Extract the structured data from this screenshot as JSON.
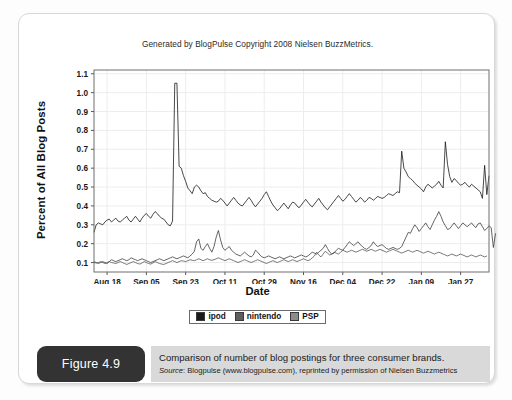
{
  "figure": {
    "badge_label": "Figure 4.9",
    "caption_main": "Comparison of number of blog postings for three consumer brands.",
    "caption_source_label": "Source",
    "caption_source_text": ": Blogpulse (www.blogpulse.com), reprinted by permission of Nielsen Buzzmetrics"
  },
  "chart_data": {
    "type": "line",
    "title": "Generated by BlogPulse Copyright 2008 Nielsen BuzzMetrics.",
    "xlabel": "Date",
    "ylabel": "Percent of All Blog Posts",
    "ylim": [
      0.05,
      1.12
    ],
    "yticks": [
      0.1,
      0.2,
      0.3,
      0.4,
      0.5,
      0.6,
      0.7,
      0.8,
      0.9,
      1.0,
      1.1
    ],
    "ytick_labels": [
      "0.1",
      "0.2",
      "0.3",
      "0.4",
      "0.5",
      "0.6",
      "0.7",
      "0.8",
      "0.9",
      "1.0",
      "1.1"
    ],
    "xtick_labels": [
      "Aug 18",
      "Sep 05",
      "Sep 23",
      "Oct 11",
      "Oct 29",
      "Nov 16",
      "Dec 04",
      "Dec 22",
      "Jan 09",
      "Jan 27"
    ],
    "xtick_positions": [
      6,
      24,
      42,
      60,
      78,
      96,
      114,
      132,
      150,
      168
    ],
    "x_count": 182,
    "grid": true,
    "legend_position": "bottom",
    "series": [
      {
        "name": "ipod",
        "color": "#1a1a1a",
        "swatch": "#1a1a1a",
        "values": [
          0.26,
          0.3,
          0.31,
          0.305,
          0.3,
          0.315,
          0.325,
          0.33,
          0.315,
          0.325,
          0.335,
          0.32,
          0.315,
          0.325,
          0.335,
          0.345,
          0.325,
          0.315,
          0.33,
          0.345,
          0.33,
          0.315,
          0.335,
          0.35,
          0.36,
          0.345,
          0.335,
          0.355,
          0.37,
          0.36,
          0.345,
          0.335,
          0.33,
          0.315,
          0.3,
          0.295,
          0.32,
          1.05,
          1.05,
          0.61,
          0.6,
          0.56,
          0.53,
          0.495,
          0.48,
          0.465,
          0.5,
          0.51,
          0.5,
          0.48,
          0.465,
          0.47,
          0.45,
          0.44,
          0.43,
          0.425,
          0.42,
          0.425,
          0.44,
          0.43,
          0.415,
          0.4,
          0.415,
          0.43,
          0.445,
          0.43,
          0.415,
          0.405,
          0.4,
          0.415,
          0.43,
          0.445,
          0.43,
          0.41,
          0.395,
          0.41,
          0.425,
          0.44,
          0.46,
          0.475,
          0.45,
          0.425,
          0.405,
          0.39,
          0.375,
          0.385,
          0.4,
          0.415,
          0.4,
          0.385,
          0.405,
          0.42,
          0.415,
          0.4,
          0.39,
          0.405,
          0.42,
          0.435,
          0.42,
          0.405,
          0.395,
          0.41,
          0.425,
          0.44,
          0.42,
          0.405,
          0.39,
          0.38,
          0.395,
          0.41,
          0.425,
          0.44,
          0.455,
          0.44,
          0.425,
          0.435,
          0.45,
          0.465,
          0.45,
          0.435,
          0.42,
          0.43,
          0.445,
          0.435,
          0.42,
          0.43,
          0.445,
          0.44,
          0.43,
          0.44,
          0.45,
          0.445,
          0.44,
          0.445,
          0.455,
          0.465,
          0.46,
          0.455,
          0.465,
          0.475,
          0.47,
          0.69,
          0.6,
          0.58,
          0.555,
          0.545,
          0.535,
          0.52,
          0.51,
          0.5,
          0.49,
          0.475,
          0.5,
          0.515,
          0.505,
          0.495,
          0.505,
          0.515,
          0.53,
          0.51,
          0.495,
          0.74,
          0.62,
          0.555,
          0.525,
          0.545,
          0.535,
          0.52,
          0.51,
          0.515,
          0.525,
          0.51,
          0.5,
          0.515,
          0.505,
          0.495,
          0.485,
          0.475,
          0.44,
          0.615,
          0.46,
          0.56
        ]
      },
      {
        "name": "nintendo",
        "color": "#3d3d3d",
        "swatch": "#5e5e5e",
        "values": [
          0.105,
          0.1,
          0.095,
          0.1,
          0.105,
          0.1,
          0.095,
          0.105,
          0.115,
          0.11,
          0.105,
          0.11,
          0.115,
          0.12,
          0.115,
          0.11,
          0.115,
          0.125,
          0.12,
          0.115,
          0.11,
          0.115,
          0.12,
          0.115,
          0.11,
          0.105,
          0.1,
          0.105,
          0.11,
          0.115,
          0.12,
          0.115,
          0.11,
          0.115,
          0.12,
          0.125,
          0.13,
          0.125,
          0.12,
          0.125,
          0.13,
          0.135,
          0.13,
          0.125,
          0.135,
          0.145,
          0.16,
          0.21,
          0.225,
          0.175,
          0.165,
          0.185,
          0.2,
          0.175,
          0.155,
          0.185,
          0.235,
          0.27,
          0.22,
          0.18,
          0.165,
          0.175,
          0.185,
          0.165,
          0.155,
          0.145,
          0.14,
          0.135,
          0.145,
          0.155,
          0.145,
          0.135,
          0.13,
          0.14,
          0.165,
          0.155,
          0.14,
          0.13,
          0.125,
          0.13,
          0.135,
          0.13,
          0.125,
          0.12,
          0.125,
          0.13,
          0.125,
          0.12,
          0.125,
          0.13,
          0.135,
          0.13,
          0.125,
          0.13,
          0.135,
          0.14,
          0.135,
          0.13,
          0.135,
          0.145,
          0.155,
          0.15,
          0.145,
          0.155,
          0.165,
          0.175,
          0.195,
          0.175,
          0.155,
          0.145,
          0.15,
          0.165,
          0.175,
          0.17,
          0.165,
          0.18,
          0.195,
          0.21,
          0.2,
          0.19,
          0.2,
          0.21,
          0.195,
          0.185,
          0.175,
          0.17,
          0.18,
          0.19,
          0.21,
          0.195,
          0.185,
          0.19,
          0.195,
          0.185,
          0.175,
          0.17,
          0.175,
          0.18,
          0.175,
          0.17,
          0.175,
          0.185,
          0.21,
          0.235,
          0.26,
          0.255,
          0.28,
          0.3,
          0.285,
          0.265,
          0.28,
          0.295,
          0.31,
          0.29,
          0.275,
          0.3,
          0.325,
          0.345,
          0.37,
          0.345,
          0.315,
          0.295,
          0.275,
          0.28,
          0.295,
          0.31,
          0.295,
          0.28,
          0.295,
          0.31,
          0.3,
          0.29,
          0.3,
          0.31,
          0.295,
          0.285,
          0.305,
          0.31,
          0.29,
          0.27,
          0.28,
          0.295,
          0.285,
          0.18,
          0.255
        ]
      },
      {
        "name": "PSP",
        "color": "#565656",
        "swatch": "#8c8c8c",
        "values": [
          0.1,
          0.098,
          0.1,
          0.105,
          0.1,
          0.095,
          0.1,
          0.105,
          0.1,
          0.098,
          0.095,
          0.1,
          0.105,
          0.1,
          0.095,
          0.09,
          0.095,
          0.1,
          0.105,
          0.1,
          0.095,
          0.092,
          0.098,
          0.105,
          0.1,
          0.095,
          0.092,
          0.098,
          0.105,
          0.1,
          0.095,
          0.092,
          0.09,
          0.095,
          0.1,
          0.105,
          0.11,
          0.105,
          0.1,
          0.105,
          0.11,
          0.108,
          0.105,
          0.11,
          0.115,
          0.112,
          0.11,
          0.115,
          0.12,
          0.115,
          0.11,
          0.115,
          0.12,
          0.115,
          0.112,
          0.115,
          0.12,
          0.125,
          0.12,
          0.115,
          0.11,
          0.115,
          0.12,
          0.115,
          0.11,
          0.105,
          0.1,
          0.105,
          0.11,
          0.115,
          0.11,
          0.105,
          0.1,
          0.105,
          0.11,
          0.115,
          0.11,
          0.105,
          0.1,
          0.095,
          0.1,
          0.105,
          0.11,
          0.105,
          0.1,
          0.105,
          0.11,
          0.115,
          0.11,
          0.105,
          0.11,
          0.115,
          0.11,
          0.105,
          0.11,
          0.115,
          0.12,
          0.115,
          0.11,
          0.115,
          0.125,
          0.135,
          0.155,
          0.14,
          0.13,
          0.145,
          0.16,
          0.15,
          0.14,
          0.145,
          0.155,
          0.15,
          0.145,
          0.155,
          0.165,
          0.16,
          0.155,
          0.16,
          0.165,
          0.16,
          0.155,
          0.16,
          0.165,
          0.17,
          0.165,
          0.16,
          0.165,
          0.17,
          0.165,
          0.16,
          0.165,
          0.17,
          0.165,
          0.16,
          0.155,
          0.16,
          0.165,
          0.17,
          0.165,
          0.16,
          0.155,
          0.15,
          0.155,
          0.16,
          0.165,
          0.16,
          0.155,
          0.16,
          0.165,
          0.16,
          0.155,
          0.15,
          0.155,
          0.16,
          0.155,
          0.15,
          0.145,
          0.15,
          0.155,
          0.15,
          0.145,
          0.14,
          0.135,
          0.14,
          0.145,
          0.14,
          0.135,
          0.14,
          0.145,
          0.14,
          0.135,
          0.13,
          0.135,
          0.14,
          0.135,
          0.13,
          0.135,
          0.14,
          0.135,
          0.13,
          0.135
        ]
      }
    ]
  }
}
